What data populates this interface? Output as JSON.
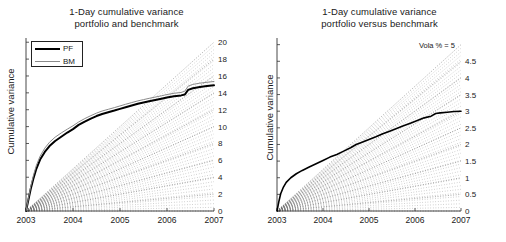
{
  "figure": {
    "width": 506,
    "height": 242,
    "background": "#ffffff",
    "panels": [
      "left",
      "right"
    ]
  },
  "left": {
    "title_line1": "1-Day cumulative variance",
    "title_line2": "portfolio and benchmark",
    "ylabel": "Cumulative variance",
    "legend": {
      "items": [
        {
          "label": "PF",
          "color": "#000000",
          "width": 2
        },
        {
          "label": "BM",
          "color": "#8a8a8a",
          "width": 1
        }
      ]
    }
  },
  "right": {
    "title_line1": "1-Day cumulative variance",
    "title_line2": "portfolio versus benchmark",
    "ylabel": "Cumulative variance",
    "vola_annotation": "Vola % = 5"
  },
  "chart_data": [
    {
      "id": "left",
      "type": "line",
      "title": "1-Day cumulative variance portfolio and benchmark",
      "xlabel": "",
      "ylabel": "Cumulative variance",
      "xlim": [
        2003,
        2007
      ],
      "ylim": [
        0,
        20.5
      ],
      "xticks": [
        2003,
        2004,
        2005,
        2006,
        2007
      ],
      "xticklabels": [
        "2003",
        "2004",
        "2005",
        "2006",
        "2007"
      ],
      "yticks_left_labeled": false,
      "right_axis_ticklabels": [
        "20",
        "18",
        "16",
        "14",
        "12",
        "10",
        "8",
        "6",
        "4",
        "2",
        "0"
      ],
      "right_axis_tickvalues": [
        20,
        18,
        16,
        14,
        12,
        10,
        8,
        6,
        4,
        2,
        0
      ],
      "grid": false,
      "legend_position": "upper-left",
      "reference_rays": {
        "style": "dotted",
        "color": "#707070",
        "description": "Fan of dotted straight lines from origin (2003,0) to right-edge values",
        "end_values": [
          20,
          18,
          16,
          14,
          12,
          10,
          8,
          6,
          4,
          2,
          0
        ]
      },
      "series": [
        {
          "name": "PF",
          "color": "#000000",
          "linewidth": 2,
          "x": [
            2003.0,
            2003.05,
            2003.1,
            2003.16,
            2003.22,
            2003.3,
            2003.4,
            2003.5,
            2003.62,
            2003.75,
            2003.88,
            2004.0,
            2004.12,
            2004.25,
            2004.38,
            2004.5,
            2004.62,
            2004.75,
            2004.88,
            2005.0,
            2005.12,
            2005.25,
            2005.38,
            2005.5,
            2005.62,
            2005.75,
            2005.88,
            2006.0,
            2006.15,
            2006.3,
            2006.38,
            2006.45,
            2006.55,
            2006.7,
            2006.85,
            2007.0
          ],
          "y": [
            0.0,
            1.3,
            2.6,
            3.9,
            5.0,
            6.1,
            7.0,
            7.7,
            8.3,
            8.8,
            9.3,
            9.7,
            10.2,
            10.6,
            10.95,
            11.25,
            11.5,
            11.7,
            11.9,
            12.1,
            12.3,
            12.5,
            12.7,
            12.85,
            13.0,
            13.15,
            13.3,
            13.45,
            13.6,
            13.7,
            13.8,
            14.35,
            14.55,
            14.7,
            14.8,
            14.9
          ]
        },
        {
          "name": "BM",
          "color": "#8a8a8a",
          "linewidth": 1,
          "x": [
            2003.0,
            2003.05,
            2003.1,
            2003.16,
            2003.22,
            2003.3,
            2003.4,
            2003.5,
            2003.62,
            2003.75,
            2003.88,
            2004.0,
            2004.12,
            2004.25,
            2004.38,
            2004.5,
            2004.62,
            2004.75,
            2004.88,
            2005.0,
            2005.12,
            2005.25,
            2005.38,
            2005.5,
            2005.62,
            2005.75,
            2005.88,
            2006.0,
            2006.15,
            2006.3,
            2006.38,
            2006.45,
            2006.55,
            2006.7,
            2006.85,
            2007.0
          ],
          "y": [
            0.0,
            1.45,
            2.9,
            4.25,
            5.4,
            6.5,
            7.45,
            8.15,
            8.75,
            9.25,
            9.7,
            10.1,
            10.55,
            10.95,
            11.3,
            11.6,
            11.85,
            12.05,
            12.25,
            12.45,
            12.65,
            12.85,
            13.05,
            13.2,
            13.35,
            13.5,
            13.65,
            13.8,
            13.95,
            14.05,
            14.2,
            14.8,
            15.0,
            15.15,
            15.25,
            15.35
          ]
        }
      ]
    },
    {
      "id": "right",
      "type": "line",
      "title": "1-Day cumulative variance portfolio versus benchmark",
      "xlabel": "",
      "ylabel": "Cumulative variance",
      "xlim": [
        2003,
        2007
      ],
      "ylim": [
        0,
        5.2
      ],
      "xticks": [
        2003,
        2004,
        2005,
        2006,
        2007
      ],
      "xticklabels": [
        "2003",
        "2004",
        "2005",
        "2006",
        "2007"
      ],
      "yticks_left_labeled": false,
      "right_axis_ticklabels": [
        "Vola % = 5",
        "4.5",
        "4",
        "3.5",
        "3",
        "2.5",
        "2",
        "1.5",
        "1",
        "0.5",
        "0"
      ],
      "right_axis_tickvalues": [
        5,
        4.5,
        4,
        3.5,
        3,
        2.5,
        2,
        1.5,
        1,
        0.5,
        0
      ],
      "grid": false,
      "legend_position": "none",
      "reference_rays": {
        "style": "dotted",
        "color": "#707070",
        "description": "Fan of dotted straight lines from origin (2003,0) labelled with annualised volatility percentages",
        "end_values": [
          5,
          4.5,
          4,
          3.5,
          3,
          2.5,
          2,
          1.5,
          1,
          0.5,
          0
        ]
      },
      "series": [
        {
          "name": "PF vs BM",
          "color": "#000000",
          "linewidth": 1.6,
          "x": [
            2003.0,
            2003.04,
            2003.08,
            2003.14,
            2003.2,
            2003.3,
            2003.42,
            2003.55,
            2003.7,
            2003.85,
            2004.0,
            2004.15,
            2004.3,
            2004.45,
            2004.6,
            2004.72,
            2004.85,
            2005.0,
            2005.15,
            2005.3,
            2005.45,
            2005.6,
            2005.75,
            2005.9,
            2006.05,
            2006.2,
            2006.35,
            2006.45,
            2006.55,
            2006.7,
            2006.85,
            2007.0
          ],
          "y": [
            0.0,
            0.28,
            0.52,
            0.72,
            0.86,
            1.0,
            1.12,
            1.22,
            1.32,
            1.42,
            1.52,
            1.62,
            1.7,
            1.8,
            1.9,
            2.0,
            2.07,
            2.15,
            2.23,
            2.32,
            2.4,
            2.48,
            2.56,
            2.64,
            2.72,
            2.8,
            2.85,
            2.93,
            2.95,
            2.97,
            2.99,
            3.0
          ]
        }
      ]
    }
  ]
}
